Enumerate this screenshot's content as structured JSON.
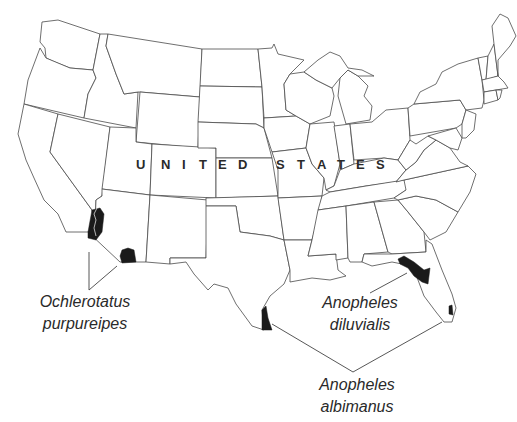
{
  "map": {
    "region": "Contiguous United States",
    "country_label_letters": [
      "U",
      "N",
      "I",
      "T",
      "E",
      "D",
      "S",
      "T",
      "A",
      "T",
      "E",
      "S"
    ],
    "country_label": "UNITED STATES",
    "range_fill_color": "#1a1a1a",
    "outline_color": "#4a4a4a",
    "background_color": "#ffffff"
  },
  "species": [
    {
      "name_line1": "Ochlerotatus",
      "name_line2": "purpureipes",
      "ranges": [
        "southeastern California / western Arizona (Colorado River)",
        "southern Arizona"
      ]
    },
    {
      "name_line1": "Anopheles",
      "name_line2": "diluvialis",
      "ranges": [
        "northern Florida / Florida panhandle"
      ]
    },
    {
      "name_line1": "Anopheles",
      "name_line2": "albimanus",
      "ranges": [
        "southern tip of Texas",
        "southeastern tip of Florida"
      ]
    }
  ]
}
